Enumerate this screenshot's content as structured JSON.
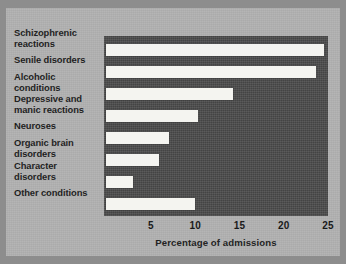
{
  "chart_data": {
    "type": "bar",
    "orientation": "horizontal",
    "title": "",
    "xlabel": "Percentage of admissions",
    "ylabel": "",
    "xlim": [
      0,
      25.3
    ],
    "xticks": [
      5,
      10,
      15,
      20,
      25
    ],
    "xtick_labels": [
      "5",
      "10",
      "15",
      "20",
      "25"
    ],
    "grid": false,
    "legend": null,
    "categories": [
      "Schizophrenic\nreactions",
      "Senile disorders",
      "Alcoholic\nconditions",
      "Depressive and\nmanic reactions",
      "Neuroses",
      "Organic brain\ndisorders",
      "Character\ndisorders",
      "Other conditions"
    ],
    "values": [
      24.6,
      23.6,
      14.3,
      10.3,
      7.0,
      5.9,
      3.0,
      10.0
    ],
    "bar_color": "#f4f4f0",
    "plot_background": "#4b4b4b",
    "figure_background": "#b2b2b2",
    "text_color": "#1b1b1b"
  }
}
